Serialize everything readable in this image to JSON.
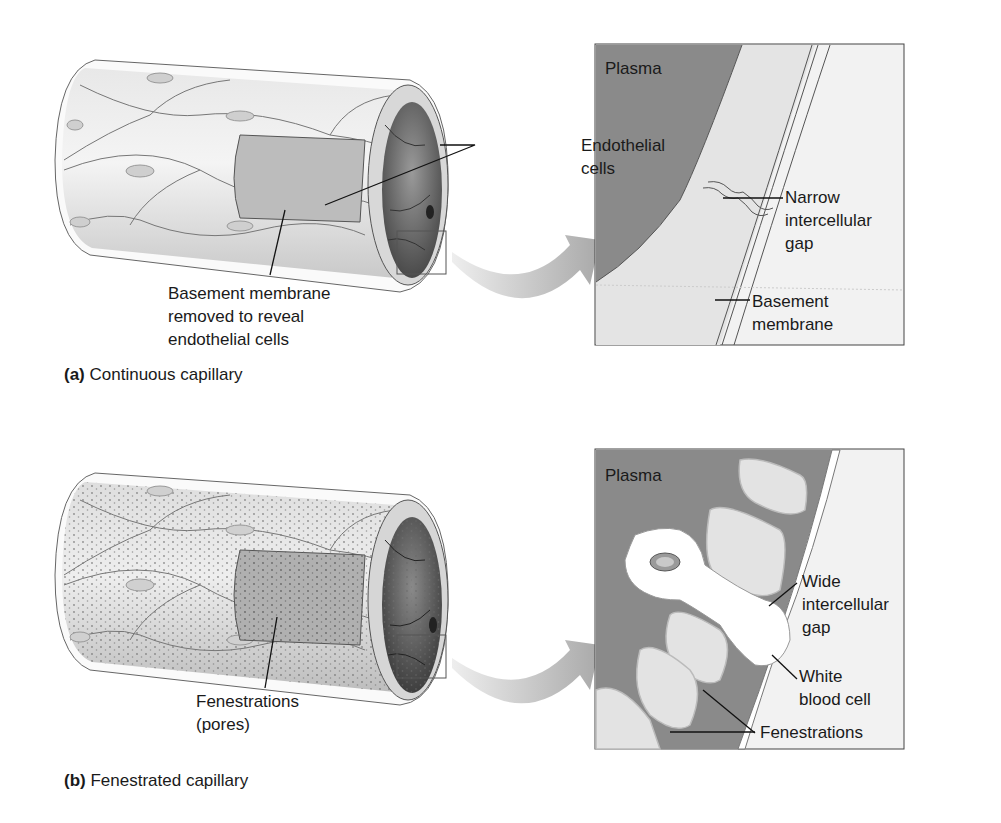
{
  "figure": {
    "panels": [
      {
        "id": "a",
        "caption_letter": "(a)",
        "caption_text": " Continuous capillary",
        "tube_labels": {
          "endothelial": "Endothelial\ncells",
          "basement": "Basement membrane\nremoved to reveal\nendothelial cells"
        },
        "inset_labels": {
          "plasma": "Plasma",
          "gap": "Narrow\nintercellular\ngap",
          "basement": "Basement\nmembrane"
        }
      },
      {
        "id": "b",
        "caption_letter": "(b)",
        "caption_text": " Fenestrated capillary",
        "tube_labels": {
          "fenestrations": "Fenestrations\n(pores)"
        },
        "inset_labels": {
          "plasma": "Plasma",
          "gap": "Wide\nintercellular\ngap",
          "wbc": "White\nblood cell",
          "fenestrations": "Fenestrations"
        }
      }
    ],
    "colors": {
      "plasma": "#8a8a8a",
      "cell": "#dcdcdc",
      "outline": "#3a3a3a",
      "arrow": "#b5b5b5",
      "background": "#ffffff"
    }
  }
}
